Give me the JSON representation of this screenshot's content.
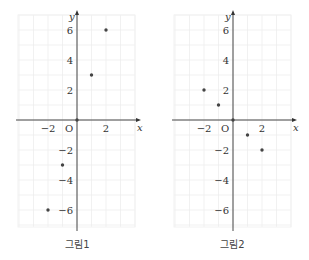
{
  "chart_data": [
    {
      "type": "scatter",
      "title": "그림1",
      "xlabel": "x",
      "ylabel": "y",
      "origin_label": "O",
      "xlim": [
        -4,
        4
      ],
      "ylim": [
        -7,
        7
      ],
      "grid": true,
      "x_ticks": [
        -2,
        2
      ],
      "y_ticks": [
        6,
        4,
        2,
        -2,
        -4,
        -6
      ],
      "x_tick_labels": [
        "−2",
        "2"
      ],
      "y_tick_labels": [
        "6",
        "4",
        "2",
        "−2",
        "−4",
        "−6"
      ],
      "points": [
        {
          "x": -2,
          "y": -6
        },
        {
          "x": -1,
          "y": -3
        },
        {
          "x": 0,
          "y": 0
        },
        {
          "x": 1,
          "y": 3
        },
        {
          "x": 2,
          "y": 6
        }
      ]
    },
    {
      "type": "scatter",
      "title": "그림2",
      "xlabel": "x",
      "ylabel": "y",
      "origin_label": "O",
      "xlim": [
        -4,
        4
      ],
      "ylim": [
        -7,
        7
      ],
      "grid": true,
      "x_ticks": [
        -2,
        2
      ],
      "y_ticks": [
        6,
        4,
        2,
        -2,
        -4,
        -6
      ],
      "x_tick_labels": [
        "−2",
        "2"
      ],
      "y_tick_labels": [
        "6",
        "4",
        "2",
        "−2",
        "−4",
        "−6"
      ],
      "points": [
        {
          "x": -2,
          "y": 2
        },
        {
          "x": -1,
          "y": 1
        },
        {
          "x": 0,
          "y": 0
        },
        {
          "x": 1,
          "y": -1
        },
        {
          "x": 2,
          "y": -2
        }
      ]
    }
  ],
  "captions": [
    "그림1",
    "그림2"
  ],
  "colors": {
    "axis": "#333333",
    "grid": "#eeeeee",
    "point": "#444444",
    "text": "#333333"
  }
}
